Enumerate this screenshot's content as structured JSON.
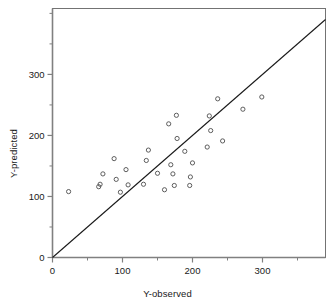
{
  "chart_data": {
    "type": "scatter",
    "title": "",
    "xlabel": "Y-observed",
    "ylabel": "Y-predicted",
    "xlim": [
      0,
      390
    ],
    "ylim": [
      0,
      408
    ],
    "xticks": [
      0,
      100,
      200,
      300
    ],
    "yticks": [
      0,
      100,
      200,
      300
    ],
    "xtick_labels": [
      "0",
      "100",
      "200",
      "300"
    ],
    "ytick_labels": [
      "0",
      "100",
      "200",
      "300"
    ],
    "xminor_step": 50,
    "yminor_step": 50,
    "grid": false,
    "legend": null,
    "marker": "open-circle",
    "marker_color": "#4d4d4d",
    "axis_color": "#808080",
    "frame_color": "#737373",
    "line_color": "#1a1a1a",
    "reference_line": {
      "name": "identity-line",
      "x": [
        0,
        390
      ],
      "y": [
        0,
        390
      ],
      "slope": 1,
      "intercept": 0
    },
    "points": [
      {
        "x": 23,
        "y": 108
      },
      {
        "x": 66,
        "y": 116
      },
      {
        "x": 68,
        "y": 120
      },
      {
        "x": 72,
        "y": 137
      },
      {
        "x": 88,
        "y": 162
      },
      {
        "x": 91,
        "y": 128
      },
      {
        "x": 97,
        "y": 107
      },
      {
        "x": 105,
        "y": 144
      },
      {
        "x": 108,
        "y": 119
      },
      {
        "x": 130,
        "y": 120
      },
      {
        "x": 134,
        "y": 159
      },
      {
        "x": 137,
        "y": 176
      },
      {
        "x": 150,
        "y": 138
      },
      {
        "x": 160,
        "y": 111
      },
      {
        "x": 166,
        "y": 219
      },
      {
        "x": 169,
        "y": 152
      },
      {
        "x": 172,
        "y": 137
      },
      {
        "x": 174,
        "y": 118
      },
      {
        "x": 177,
        "y": 233
      },
      {
        "x": 178,
        "y": 195
      },
      {
        "x": 189,
        "y": 174
      },
      {
        "x": 196,
        "y": 118
      },
      {
        "x": 197,
        "y": 132
      },
      {
        "x": 200,
        "y": 155
      },
      {
        "x": 221,
        "y": 181
      },
      {
        "x": 224,
        "y": 232
      },
      {
        "x": 226,
        "y": 208
      },
      {
        "x": 236,
        "y": 260
      },
      {
        "x": 243,
        "y": 191
      },
      {
        "x": 272,
        "y": 243
      },
      {
        "x": 299,
        "y": 263
      }
    ]
  }
}
